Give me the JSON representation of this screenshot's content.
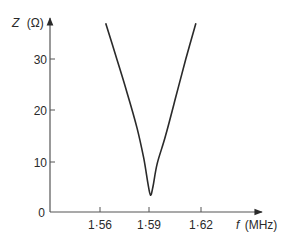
{
  "chart_data": {
    "type": "line",
    "title": "",
    "xlabel": "f (MHz)",
    "ylabel": "Z (Ω)",
    "xlabel_var": "f",
    "xlabel_unit": "(MHz)",
    "ylabel_var": "Z",
    "ylabel_unit": "(Ω)",
    "x_ticks": [
      "1·56",
      "1·59",
      "1·62"
    ],
    "x_tick_values": [
      1.56,
      1.59,
      1.62
    ],
    "y_ticks": [
      "0",
      "10",
      "20",
      "30"
    ],
    "y_tick_values": [
      0,
      10,
      20,
      30
    ],
    "xlim": [
      1.51,
      1.675
    ],
    "ylim": [
      0,
      38
    ],
    "grid": false,
    "legend": null,
    "series": [
      {
        "name": "Impedance",
        "x": [
          1.5634,
          1.57,
          1.576,
          1.582,
          1.586,
          1.5885,
          1.59,
          1.5915,
          1.594,
          1.599,
          1.605,
          1.611,
          1.617
        ],
        "y": [
          37.0,
          30.0,
          23.5,
          16.5,
          10.5,
          5.5,
          3.3,
          5.0,
          9.5,
          15.0,
          22.5,
          30.0,
          37.0
        ]
      }
    ],
    "annotations": []
  },
  "labels": {
    "y_axis_var": "Z",
    "y_axis_unit": "(Ω)",
    "x_axis_var": "f",
    "x_axis_unit": "(MHz)",
    "y_ticks": [
      "0",
      "10",
      "20",
      "30"
    ],
    "x_ticks": [
      "1·56",
      "1·59",
      "1·62"
    ]
  },
  "colors": {
    "line": "#2a2a2a",
    "axis": "#555555",
    "background": "#ffffff"
  }
}
